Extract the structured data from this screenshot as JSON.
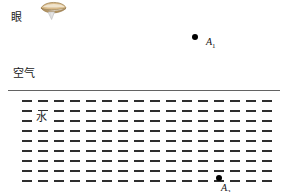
{
  "diagram": {
    "background_color": "#ffffff",
    "surface_line_color": "#636363",
    "hatch_color": "#2e2e2e",
    "point_color": "#000000",
    "eye": {
      "icon_name": "eye-icon",
      "label": "眼",
      "icon_colors": {
        "upper": "#d6b684",
        "highlight": "#efe3cc",
        "outline": "#9c7f4e",
        "cone": "#cfcfcf"
      }
    },
    "media": {
      "air_label": "空气",
      "water_label": "水"
    },
    "points": [
      {
        "name": "A1",
        "label": "A",
        "subscript": "1",
        "region": "air"
      },
      {
        "name": "A2",
        "label": "A",
        "subscript": "2",
        "region": "water"
      }
    ],
    "hatch": {
      "rows": 9,
      "columns": 16,
      "dash_width": 10,
      "dash_height": 2.4,
      "row_spacing": 10,
      "column_spacing": 16,
      "start_x": 22,
      "start_y": 4
    }
  }
}
